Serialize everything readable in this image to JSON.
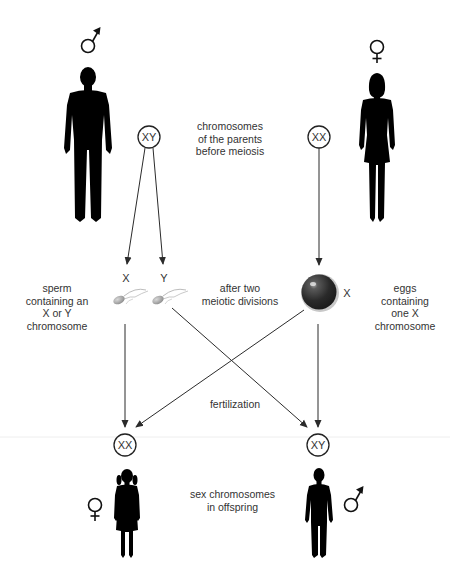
{
  "diagram": {
    "colors": {
      "background": "#ffffff",
      "text": "#333333",
      "line": "#2b2b2b",
      "silhouette": "#000000",
      "egg": "#2a2a2a",
      "sperm": "#9a9a9a"
    },
    "parents": {
      "father": {
        "symbol": "male-symbol",
        "chromosomes": "XY"
      },
      "mother": {
        "symbol": "female-symbol",
        "chromosomes": "XX"
      },
      "caption": "chromosomes\nof the parents\nbefore meiosis"
    },
    "gametes": {
      "sperm": {
        "labels": [
          "X",
          "Y"
        ],
        "caption": "sperm\ncontaining an\nX or Y\nchromosome"
      },
      "meiosis_caption": "after two\nmeiotic divisions",
      "egg": {
        "label": "X",
        "caption": "eggs\ncontaining\none X\nchromosome"
      }
    },
    "fertilization_label": "fertilization",
    "offspring": {
      "daughter": {
        "symbol": "female-symbol",
        "chromosomes": "XX"
      },
      "son": {
        "symbol": "male-symbol",
        "chromosomes": "XY"
      },
      "caption": "sex chromosomes\nin offspring"
    }
  }
}
